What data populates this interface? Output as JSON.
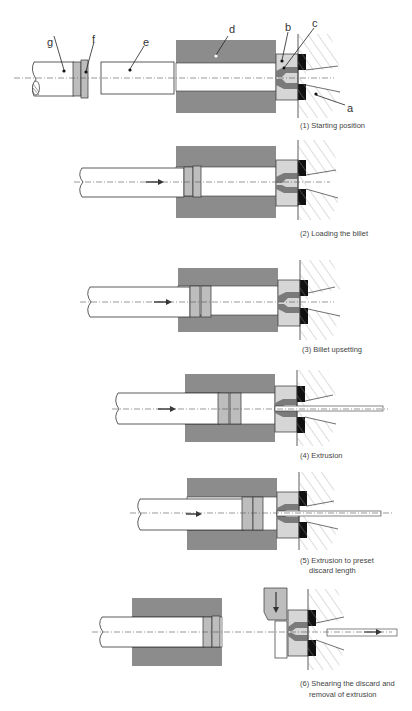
{
  "colors": {
    "container": "#8c8c8c",
    "die_holder": "#d6d6d6",
    "die": "#7a7a7a",
    "dummy_block": "#b0b0b0",
    "seal": "#111111",
    "outline": "#333333",
    "background": "#ffffff"
  },
  "labels": {
    "a": "a",
    "b": "b",
    "c": "c",
    "d": "d",
    "e": "e",
    "f": "f",
    "g": "g"
  },
  "steps": [
    {
      "number": "(1)",
      "caption": "(1) Starting position"
    },
    {
      "number": "(2)",
      "caption": "(2) Loading the billet"
    },
    {
      "number": "(3)",
      "caption": "(3) Billet upsetting"
    },
    {
      "number": "(4)",
      "caption": "(4) Extrusion"
    },
    {
      "number": "(5)",
      "caption_line1": "(5) Extrusion to preset",
      "caption_line2": "discard length"
    },
    {
      "number": "(6)",
      "caption_line1": "(6) Shearing the discard and",
      "caption_line2": "removal of extrusion"
    }
  ]
}
